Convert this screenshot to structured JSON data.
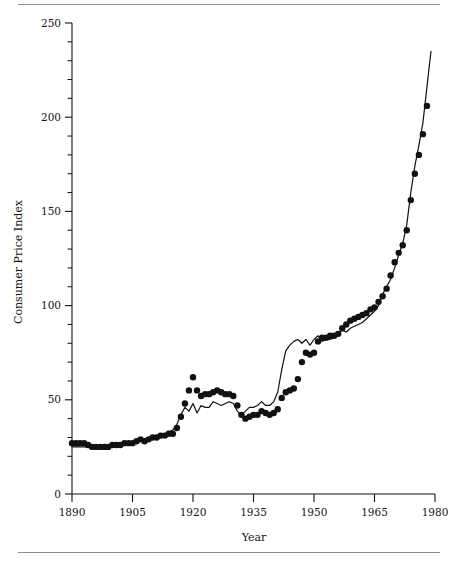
{
  "figure": {
    "rule_color": "#8e8e8e",
    "background": "#ffffff",
    "ink_color": "#111111"
  },
  "chart_data": {
    "type": "scatter",
    "title": "",
    "subtitle": "",
    "xlabel": "Year",
    "ylabel": "Consumer Price Index",
    "xlim": [
      1890,
      1980
    ],
    "ylim": [
      0,
      250
    ],
    "xticks": [
      1890,
      1905,
      1920,
      1935,
      1950,
      1965,
      1980
    ],
    "xtick_labels": [
      "1890",
      "1905",
      "1920",
      "1935",
      "1950",
      "1965",
      "1980"
    ],
    "yticks": [
      0,
      50,
      100,
      150,
      200,
      250
    ],
    "ytick_labels": [
      "0",
      "50",
      "100",
      "150",
      "200",
      "250"
    ],
    "y_minor_tick_step": 10,
    "x_minor_ticks": false,
    "grid": false,
    "legend": null,
    "legend_position": null,
    "axis_style": "left-and-bottom-spines-only",
    "series": [
      {
        "name": "observed",
        "marker": "filled-circle",
        "marker_size_px": 3.2,
        "color": "#111111",
        "line": false,
        "x": [
          1890,
          1891,
          1892,
          1893,
          1894,
          1895,
          1896,
          1897,
          1898,
          1899,
          1900,
          1901,
          1902,
          1903,
          1904,
          1905,
          1906,
          1907,
          1908,
          1909,
          1910,
          1911,
          1912,
          1913,
          1914,
          1915,
          1916,
          1917,
          1918,
          1919,
          1920,
          1921,
          1922,
          1923,
          1924,
          1925,
          1926,
          1927,
          1928,
          1929,
          1930,
          1931,
          1932,
          1933,
          1934,
          1935,
          1936,
          1937,
          1938,
          1939,
          1940,
          1941,
          1942,
          1943,
          1944,
          1945,
          1946,
          1947,
          1948,
          1949,
          1950,
          1951,
          1952,
          1953,
          1954,
          1955,
          1956,
          1957,
          1958,
          1959,
          1960,
          1961,
          1962,
          1963,
          1964,
          1965,
          1966,
          1967,
          1968,
          1969,
          1970,
          1971,
          1972,
          1973,
          1974,
          1975,
          1976,
          1977,
          1978
        ],
        "y": [
          27,
          27,
          27,
          27,
          26,
          25,
          25,
          25,
          25,
          25,
          26,
          26,
          26,
          27,
          27,
          27,
          28,
          29,
          28,
          29,
          30,
          30,
          31,
          31,
          32,
          32,
          35,
          41,
          48,
          55,
          62,
          55,
          52,
          53,
          53,
          54,
          55,
          54,
          53,
          53,
          52,
          47,
          42,
          40,
          41,
          42,
          42,
          44,
          43,
          42,
          43,
          45,
          51,
          54,
          55,
          56,
          61,
          70,
          75,
          74,
          75,
          81,
          83,
          83,
          84,
          84,
          85,
          88,
          90,
          92,
          93,
          94,
          95,
          96,
          98,
          99,
          102,
          105,
          109,
          116,
          123,
          128,
          132,
          140,
          156,
          170,
          180,
          191,
          206
        ]
      },
      {
        "name": "fitted",
        "marker": "none",
        "color": "#111111",
        "line": true,
        "line_width_px": 1.2,
        "x": [
          1890,
          1891,
          1892,
          1893,
          1894,
          1895,
          1896,
          1897,
          1898,
          1899,
          1900,
          1901,
          1902,
          1903,
          1904,
          1905,
          1906,
          1907,
          1908,
          1909,
          1910,
          1911,
          1912,
          1913,
          1914,
          1915,
          1916,
          1917,
          1918,
          1919,
          1920,
          1921,
          1922,
          1923,
          1924,
          1925,
          1926,
          1927,
          1928,
          1929,
          1930,
          1931,
          1932,
          1933,
          1934,
          1935,
          1936,
          1937,
          1938,
          1939,
          1940,
          1941,
          1942,
          1943,
          1944,
          1945,
          1946,
          1947,
          1948,
          1949,
          1950,
          1951,
          1952,
          1953,
          1954,
          1955,
          1956,
          1957,
          1958,
          1959,
          1960,
          1961,
          1962,
          1963,
          1964,
          1965,
          1966,
          1967,
          1968,
          1969,
          1970,
          1971,
          1972,
          1973,
          1974,
          1975,
          1976,
          1977,
          1978,
          1979
        ],
        "y": [
          25,
          25,
          25,
          25,
          25,
          25,
          25,
          25,
          25,
          25,
          26,
          26,
          26,
          27,
          27,
          27,
          28,
          29,
          29,
          30,
          31,
          31,
          32,
          32,
          33,
          34,
          37,
          42,
          46,
          44,
          48,
          43,
          47,
          46,
          46,
          49,
          48,
          47,
          48,
          49,
          48,
          44,
          42,
          44,
          46,
          46,
          47,
          49,
          47,
          47,
          49,
          54,
          66,
          76,
          79,
          81,
          82,
          80,
          82,
          79,
          82,
          84,
          81,
          82,
          82,
          83,
          85,
          87,
          86,
          88,
          89,
          90,
          91,
          93,
          95,
          97,
          100,
          106,
          110,
          114,
          120,
          127,
          133,
          143,
          160,
          174,
          185,
          197,
          216,
          235
        ]
      }
    ],
    "annotations": []
  },
  "layout": {
    "plot_left_px": 72,
    "plot_right_px": 435,
    "plot_top_px": 23,
    "plot_bottom_px": 494
  }
}
